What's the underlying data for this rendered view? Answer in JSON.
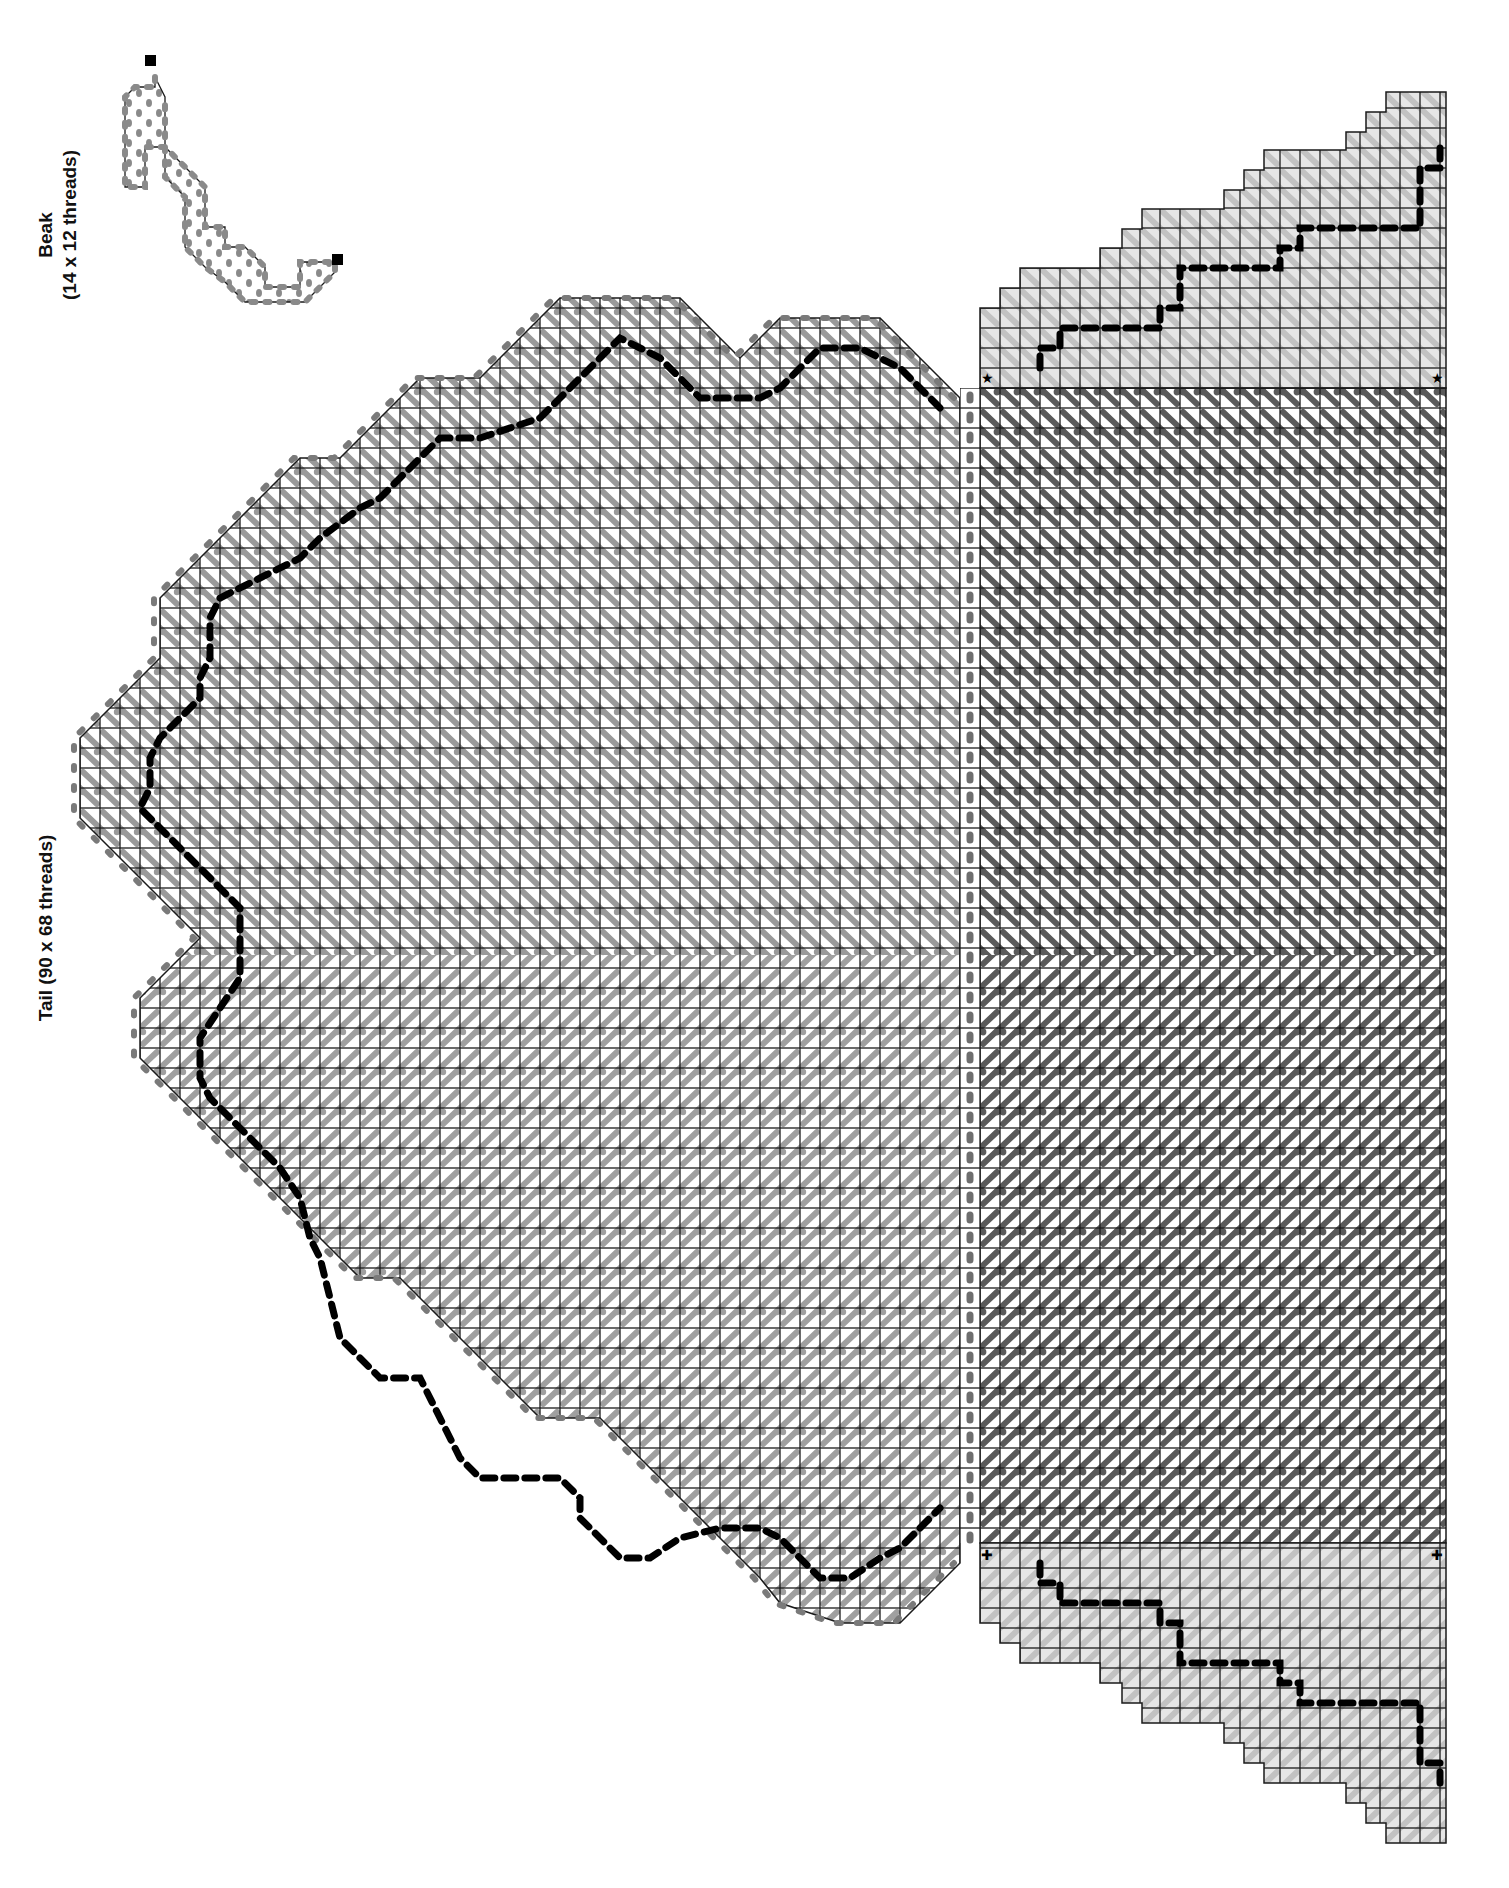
{
  "labels": {
    "beak_title": "Beak",
    "beak_size": "(14 x 12 threads)",
    "tail_title": "Tail (90 x 68 threads)"
  },
  "colors": {
    "background": "#ffffff",
    "grid_line": "#1a1a1a",
    "panel_fill": "#e6e6e6",
    "stitch_light": "#bcbcbc",
    "stitch_mid": "#8c8c8c",
    "stitch_dark": "#555555",
    "overcast_dot": "#6e6e6e",
    "backstitch": "#000000"
  },
  "pieces": [
    {
      "name": "Beak",
      "width_threads": 14,
      "height_threads": 12,
      "marker": "square"
    },
    {
      "name": "Tail",
      "width_threads": 90,
      "height_threads": 68,
      "markers": [
        "star",
        "plus"
      ]
    }
  ],
  "markers": {
    "star_symbol": "★",
    "plus_symbol": "✚",
    "square_symbol": "■"
  },
  "geometry": {
    "cell": 20,
    "body": {
      "x0": 980,
      "x1": 1446,
      "y0": 388,
      "y1": 1543
    },
    "tail_right_x": 960,
    "tail_split_y": 955,
    "upper_panel_steps": [
      [
        980,
        308
      ],
      [
        1000,
        288
      ],
      [
        1020,
        268
      ],
      [
        1080,
        268
      ],
      [
        1100,
        248
      ],
      [
        1122,
        229
      ],
      [
        1142,
        209
      ],
      [
        1202,
        209
      ],
      [
        1224,
        190
      ],
      [
        1244,
        170
      ],
      [
        1264,
        150
      ],
      [
        1324,
        150
      ],
      [
        1346,
        132
      ],
      [
        1366,
        112
      ],
      [
        1386,
        92
      ],
      [
        1446,
        92
      ]
    ],
    "lower_panel_steps": [
      [
        980,
        1623
      ],
      [
        1000,
        1643
      ],
      [
        1020,
        1663
      ],
      [
        1080,
        1663
      ],
      [
        1100,
        1683
      ],
      [
        1122,
        1703
      ],
      [
        1142,
        1723
      ],
      [
        1202,
        1723
      ],
      [
        1224,
        1743
      ],
      [
        1244,
        1763
      ],
      [
        1264,
        1783
      ],
      [
        1324,
        1783
      ],
      [
        1346,
        1803
      ],
      [
        1366,
        1823
      ],
      [
        1386,
        1843
      ],
      [
        1446,
        1843
      ]
    ],
    "tail_outline": [
      [
        960,
        398
      ],
      [
        940,
        378
      ],
      [
        920,
        358
      ],
      [
        900,
        338
      ],
      [
        880,
        318
      ],
      [
        780,
        318
      ],
      [
        760,
        338
      ],
      [
        740,
        358
      ],
      [
        720,
        338
      ],
      [
        700,
        318
      ],
      [
        680,
        298
      ],
      [
        560,
        298
      ],
      [
        540,
        318
      ],
      [
        520,
        338
      ],
      [
        500,
        358
      ],
      [
        480,
        378
      ],
      [
        420,
        378
      ],
      [
        400,
        398
      ],
      [
        380,
        418
      ],
      [
        360,
        438
      ],
      [
        340,
        458
      ],
      [
        300,
        458
      ],
      [
        280,
        478
      ],
      [
        260,
        498
      ],
      [
        240,
        518
      ],
      [
        220,
        538
      ],
      [
        200,
        558
      ],
      [
        180,
        578
      ],
      [
        160,
        598
      ],
      [
        160,
        658
      ],
      [
        140,
        678
      ],
      [
        120,
        698
      ],
      [
        100,
        718
      ],
      [
        80,
        738
      ],
      [
        80,
        818
      ],
      [
        100,
        838
      ],
      [
        120,
        858
      ],
      [
        140,
        878
      ],
      [
        160,
        898
      ],
      [
        180,
        918
      ],
      [
        200,
        938
      ],
      [
        180,
        958
      ],
      [
        160,
        978
      ],
      [
        140,
        998
      ],
      [
        140,
        1058
      ],
      [
        160,
        1078
      ],
      [
        180,
        1098
      ],
      [
        200,
        1118
      ],
      [
        220,
        1138
      ],
      [
        240,
        1158
      ],
      [
        260,
        1178
      ],
      [
        280,
        1198
      ],
      [
        300,
        1218
      ],
      [
        320,
        1238
      ],
      [
        340,
        1258
      ],
      [
        360,
        1278
      ],
      [
        400,
        1278
      ],
      [
        420,
        1298
      ],
      [
        440,
        1318
      ],
      [
        460,
        1338
      ],
      [
        480,
        1358
      ],
      [
        500,
        1378
      ],
      [
        520,
        1398
      ],
      [
        540,
        1418
      ],
      [
        600,
        1418
      ],
      [
        620,
        1438
      ],
      [
        640,
        1458
      ],
      [
        660,
        1478
      ],
      [
        680,
        1498
      ],
      [
        700,
        1518
      ],
      [
        720,
        1538
      ],
      [
        740,
        1558
      ],
      [
        760,
        1578
      ],
      [
        780,
        1603
      ],
      [
        840,
        1623
      ],
      [
        900,
        1623
      ],
      [
        920,
        1603
      ],
      [
        940,
        1583
      ],
      [
        960,
        1563
      ]
    ],
    "backstitch_upper_panel": [
      [
        1040,
        368
      ],
      [
        1040,
        348
      ],
      [
        1060,
        348
      ],
      [
        1060,
        328
      ],
      [
        1160,
        328
      ],
      [
        1160,
        308
      ],
      [
        1180,
        308
      ],
      [
        1180,
        288
      ],
      [
        1180,
        268
      ],
      [
        1280,
        268
      ],
      [
        1280,
        248
      ],
      [
        1300,
        248
      ],
      [
        1300,
        228
      ],
      [
        1420,
        228
      ],
      [
        1420,
        208
      ],
      [
        1420,
        168
      ],
      [
        1440,
        168
      ],
      [
        1440,
        148
      ]
    ],
    "backstitch_lower_panel": [
      [
        1040,
        1563
      ],
      [
        1040,
        1583
      ],
      [
        1060,
        1583
      ],
      [
        1060,
        1603
      ],
      [
        1160,
        1603
      ],
      [
        1160,
        1623
      ],
      [
        1180,
        1623
      ],
      [
        1180,
        1643
      ],
      [
        1180,
        1663
      ],
      [
        1280,
        1663
      ],
      [
        1280,
        1683
      ],
      [
        1300,
        1683
      ],
      [
        1300,
        1703
      ],
      [
        1420,
        1703
      ],
      [
        1420,
        1723
      ],
      [
        1420,
        1763
      ],
      [
        1440,
        1763
      ],
      [
        1440,
        1783
      ]
    ],
    "backstitch_tail": [
      [
        940,
        408
      ],
      [
        920,
        388
      ],
      [
        900,
        368
      ],
      [
        860,
        348
      ],
      [
        820,
        348
      ],
      [
        800,
        368
      ],
      [
        780,
        388
      ],
      [
        760,
        398
      ],
      [
        700,
        398
      ],
      [
        680,
        378
      ],
      [
        660,
        358
      ],
      [
        640,
        348
      ],
      [
        620,
        338
      ],
      [
        600,
        358
      ],
      [
        580,
        378
      ],
      [
        560,
        398
      ],
      [
        540,
        418
      ],
      [
        480,
        438
      ],
      [
        440,
        438
      ],
      [
        420,
        458
      ],
      [
        400,
        478
      ],
      [
        380,
        498
      ],
      [
        360,
        508
      ],
      [
        320,
        538
      ],
      [
        300,
        558
      ],
      [
        260,
        578
      ],
      [
        220,
        598
      ],
      [
        210,
        618
      ],
      [
        210,
        658
      ],
      [
        200,
        678
      ],
      [
        200,
        698
      ],
      [
        180,
        718
      ],
      [
        160,
        738
      ],
      [
        150,
        758
      ],
      [
        150,
        788
      ],
      [
        140,
        808
      ],
      [
        160,
        828
      ],
      [
        180,
        848
      ],
      [
        200,
        868
      ],
      [
        220,
        888
      ],
      [
        240,
        908
      ],
      [
        240,
        938
      ],
      [
        240,
        978
      ],
      [
        220,
        1008
      ],
      [
        200,
        1038
      ],
      [
        200,
        1078
      ],
      [
        210,
        1098
      ],
      [
        230,
        1118
      ],
      [
        260,
        1148
      ],
      [
        280,
        1168
      ],
      [
        300,
        1198
      ],
      [
        310,
        1238
      ],
      [
        320,
        1258
      ],
      [
        330,
        1298
      ],
      [
        340,
        1338
      ],
      [
        360,
        1358
      ],
      [
        380,
        1378
      ],
      [
        400,
        1378
      ],
      [
        420,
        1378
      ],
      [
        440,
        1418
      ],
      [
        450,
        1438
      ],
      [
        460,
        1458
      ],
      [
        480,
        1478
      ],
      [
        500,
        1478
      ],
      [
        540,
        1478
      ],
      [
        560,
        1478
      ],
      [
        580,
        1498
      ],
      [
        580,
        1518
      ],
      [
        600,
        1538
      ],
      [
        620,
        1558
      ],
      [
        650,
        1558
      ],
      [
        680,
        1538
      ],
      [
        720,
        1528
      ],
      [
        760,
        1528
      ],
      [
        780,
        1538
      ],
      [
        800,
        1558
      ],
      [
        820,
        1578
      ],
      [
        850,
        1578
      ],
      [
        880,
        1558
      ],
      [
        900,
        1548
      ],
      [
        920,
        1528
      ],
      [
        940,
        1508
      ]
    ]
  },
  "beak": {
    "outline": [
      [
        155,
        77
      ],
      [
        155,
        87
      ],
      [
        135,
        87
      ],
      [
        125,
        97
      ],
      [
        125,
        187
      ],
      [
        145,
        187
      ],
      [
        145,
        147
      ],
      [
        165,
        147
      ],
      [
        185,
        167
      ],
      [
        205,
        187
      ],
      [
        205,
        227
      ],
      [
        225,
        227
      ],
      [
        225,
        247
      ],
      [
        245,
        247
      ],
      [
        265,
        267
      ],
      [
        265,
        287
      ],
      [
        300,
        287
      ],
      [
        300,
        262
      ],
      [
        335,
        262
      ],
      [
        335,
        272
      ],
      [
        315,
        292
      ],
      [
        305,
        302
      ],
      [
        245,
        302
      ],
      [
        225,
        282
      ],
      [
        205,
        267
      ],
      [
        185,
        247
      ],
      [
        185,
        197
      ],
      [
        165,
        177
      ],
      [
        165,
        97
      ]
    ],
    "square_markers": [
      [
        150,
        60
      ],
      [
        338,
        260
      ]
    ]
  },
  "tail_markers": {
    "stars": [
      [
        988,
        377
      ],
      [
        1438,
        377
      ]
    ],
    "plus": [
      [
        988,
        1553
      ],
      [
        1438,
        1553
      ]
    ]
  }
}
